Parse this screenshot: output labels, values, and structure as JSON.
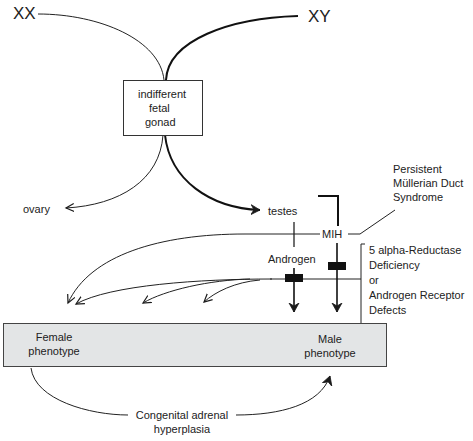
{
  "diagram": {
    "chromosomes": {
      "xx": "XX",
      "xy": "XY"
    },
    "gonad_box": {
      "lines": [
        "indifferent",
        "fetal",
        "gonad"
      ]
    },
    "gonads": {
      "ovary": "ovary",
      "testes": "testes"
    },
    "hormones": {
      "mih": "MIH",
      "androgen": "Androgen"
    },
    "syndromes": {
      "pmds": [
        "Persistent",
        "Müllerian Duct",
        "Syndrome"
      ],
      "androgen_defects": [
        "5 alpha-Reductase",
        "Deficiency",
        "or",
        "Androgen Receptor",
        "Defects"
      ]
    },
    "phenotypes": {
      "female": [
        "Female",
        "phenotype"
      ],
      "male": [
        "Male",
        "phenotype"
      ]
    },
    "cah": [
      "Congenital adrenal",
      "hyperplasia"
    ],
    "colors": {
      "phenotype_fill": "#e3e5e6",
      "line": "#1a1a1a"
    }
  }
}
